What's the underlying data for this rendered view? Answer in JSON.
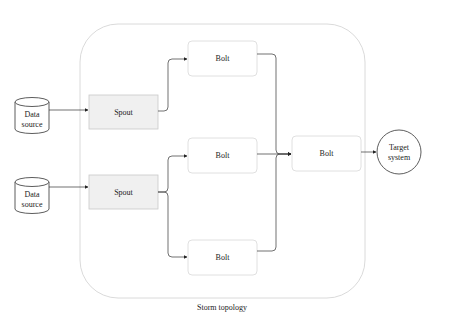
{
  "diagram": {
    "container_label": "Storm topology",
    "data_sources": [
      {
        "line1": "Data",
        "line2": "source"
      },
      {
        "line1": "Data",
        "line2": "source"
      }
    ],
    "spouts": [
      {
        "label": "Spout"
      },
      {
        "label": "Spout"
      }
    ],
    "bolts": [
      {
        "label": "Bolt"
      },
      {
        "label": "Bolt"
      },
      {
        "label": "Bolt"
      },
      {
        "label": "Bolt"
      }
    ],
    "target": {
      "line1": "Target",
      "line2": "system"
    },
    "colors": {
      "spout_fill": "#f0f0f0",
      "bolt_fill": "#ffffff",
      "border": "#c8c8c8",
      "edge": "#333333",
      "container_border": "#d0d0d0"
    }
  }
}
